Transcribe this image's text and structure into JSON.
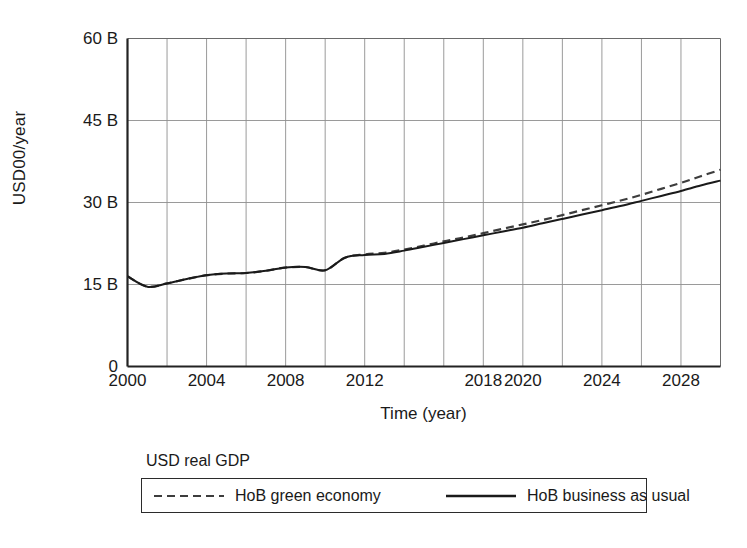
{
  "chart_data": {
    "type": "line",
    "title": "",
    "xlabel": "Time (year)",
    "ylabel": "USD00/year",
    "xlim": [
      2000,
      2030
    ],
    "ylim": [
      0,
      60
    ],
    "grid": true,
    "y_ticks": [
      {
        "value": 0,
        "label": "0"
      },
      {
        "value": 15,
        "label": "15 B"
      },
      {
        "value": 30,
        "label": "30 B"
      },
      {
        "value": 45,
        "label": "45 B"
      },
      {
        "value": 60,
        "label": "60 B"
      }
    ],
    "x_ticks": [
      {
        "value": 2000,
        "label": "2000"
      },
      {
        "value": 2004,
        "label": "2004"
      },
      {
        "value": 2008,
        "label": "2008"
      },
      {
        "value": 2012,
        "label": "2012"
      },
      {
        "value": 2018,
        "label": "2018"
      },
      {
        "value": 2020,
        "label": "2020"
      },
      {
        "value": 2024,
        "label": "2024"
      },
      {
        "value": 2028,
        "label": "2028"
      }
    ],
    "x_gridlines": [
      2000,
      2002,
      2004,
      2006,
      2008,
      2010,
      2012,
      2014,
      2016,
      2018,
      2020,
      2022,
      2024,
      2026,
      2028,
      2030
    ],
    "legend": {
      "title": "USD real GDP",
      "position": "below-plot",
      "entries": [
        {
          "name": "HoB green economy",
          "style": "dashed",
          "color": "#3d3d3d"
        },
        {
          "name": "HoB business as usual",
          "style": "solid",
          "color": "#1a1a1a"
        }
      ]
    },
    "x": [
      2000,
      2001,
      2002,
      2003,
      2004,
      2005,
      2006,
      2007,
      2008,
      2009,
      2010,
      2011,
      2012,
      2013,
      2014,
      2015,
      2016,
      2017,
      2018,
      2019,
      2020,
      2021,
      2022,
      2023,
      2024,
      2025,
      2026,
      2027,
      2028,
      2029,
      2030
    ],
    "series": [
      {
        "name": "HoB business as usual",
        "style": "solid",
        "color": "#1a1a1a",
        "values": [
          16.5,
          14.6,
          15.2,
          16.0,
          16.7,
          17.0,
          17.1,
          17.5,
          18.1,
          18.2,
          17.6,
          19.9,
          20.4,
          20.6,
          21.2,
          21.9,
          22.6,
          23.3,
          24.0,
          24.7,
          25.4,
          26.2,
          27.0,
          27.8,
          28.6,
          29.4,
          30.3,
          31.2,
          32.1,
          33.1,
          34.0
        ]
      },
      {
        "name": "HoB green economy",
        "style": "dashed",
        "color": "#3d3d3d",
        "values": [
          16.5,
          14.6,
          15.2,
          16.0,
          16.7,
          17.0,
          17.1,
          17.5,
          18.1,
          18.2,
          17.6,
          19.9,
          20.5,
          20.8,
          21.4,
          22.1,
          22.9,
          23.6,
          24.4,
          25.2,
          26.0,
          26.8,
          27.7,
          28.6,
          29.5,
          30.4,
          31.4,
          32.5,
          33.6,
          34.8,
          36.0
        ]
      }
    ]
  }
}
